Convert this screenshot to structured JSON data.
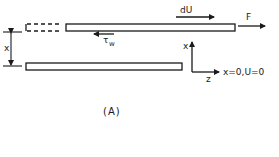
{
  "diagram": {
    "caption": "(A)",
    "labels": {
      "velocity_increment": "dU",
      "force": "F",
      "wall_shear_main": "τ",
      "wall_shear_sub": "w",
      "gap": "x",
      "axis_x": "x",
      "axis_z": "z",
      "boundary_condition": "x=0,U=0"
    },
    "colors": {
      "stroke": "#1a1a1a",
      "background": "#ffffff"
    }
  }
}
